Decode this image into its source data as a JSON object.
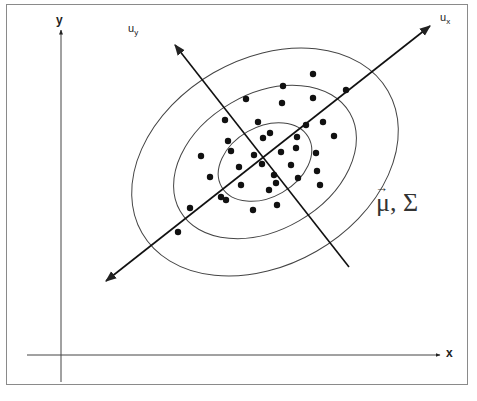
{
  "diagram": {
    "axes": {
      "x_label": "x",
      "y_label": "y"
    },
    "principal_axes": {
      "major_label": "u",
      "major_subscript": "x",
      "minor_label": "u",
      "minor_subscript": "y"
    },
    "parameters_label": {
      "mu": "μ",
      "vector_arrow": "→",
      "separator": ",",
      "sigma": "Σ"
    },
    "colors": {
      "stroke": "#222222",
      "ellipse": "#444444",
      "frame": "#8a8a8a",
      "background": "#ffffff"
    },
    "ellipses": [
      {
        "name": "inner",
        "cx": 265,
        "cy": 162,
        "rx": 50,
        "ry": 35,
        "rotation": -30
      },
      {
        "name": "middle",
        "cx": 265,
        "cy": 162,
        "rx": 98,
        "ry": 68,
        "rotation": -30
      },
      {
        "name": "outer",
        "cx": 265,
        "cy": 162,
        "rx": 142,
        "ry": 103,
        "rotation": -30
      }
    ],
    "data_points": [
      [
        313,
        74
      ],
      [
        283,
        86
      ],
      [
        346,
        90
      ],
      [
        246,
        99
      ],
      [
        282,
        103
      ],
      [
        313,
        98
      ],
      [
        225,
        120
      ],
      [
        258,
        122
      ],
      [
        306,
        125
      ],
      [
        323,
        122
      ],
      [
        334,
        136
      ],
      [
        263,
        138
      ],
      [
        270,
        133
      ],
      [
        297,
        137
      ],
      [
        228,
        141
      ],
      [
        231,
        151
      ],
      [
        201,
        156
      ],
      [
        254,
        155
      ],
      [
        281,
        152
      ],
      [
        296,
        148
      ],
      [
        316,
        153
      ],
      [
        239,
        167
      ],
      [
        262,
        164
      ],
      [
        291,
        165
      ],
      [
        210,
        177
      ],
      [
        274,
        175
      ],
      [
        298,
        178
      ],
      [
        317,
        171
      ],
      [
        241,
        185
      ],
      [
        276,
        183
      ],
      [
        269,
        190
      ],
      [
        320,
        185
      ],
      [
        221,
        197
      ],
      [
        226,
        200
      ],
      [
        190,
        208
      ],
      [
        253,
        210
      ],
      [
        277,
        205
      ],
      [
        178,
        232
      ]
    ]
  }
}
